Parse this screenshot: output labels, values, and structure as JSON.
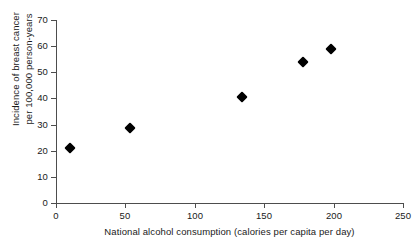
{
  "chart_data": {
    "type": "scatter",
    "title": "",
    "xlabel": "National alcohol consumption (calories per capita per day)",
    "ylabel_lines": [
      "Incidence of breast cancer",
      "per 100,000 person-years"
    ],
    "ylabel": "Incidence of breast cancer per 100,000 person-years",
    "xlim": [
      0,
      250
    ],
    "ylim": [
      0,
      70
    ],
    "xticks": [
      0,
      50,
      100,
      150,
      200,
      250
    ],
    "xtick_labels": [
      "0",
      "50",
      "100",
      "150",
      "200",
      "250"
    ],
    "yticks": [
      0,
      10,
      20,
      30,
      40,
      50,
      60,
      70
    ],
    "ytick_labels": [
      "0",
      "10",
      "20",
      "30",
      "40",
      "50",
      "60",
      "70"
    ],
    "grid": false,
    "legend": false,
    "marker_style": "filled-diamond",
    "marker_color": "#000000",
    "axis_color": "#4d4d4d",
    "series": [
      {
        "name": "Countries",
        "points": [
          {
            "x": 10,
            "y": 21
          },
          {
            "x": 53,
            "y": 28.5
          },
          {
            "x": 134,
            "y": 40.5
          },
          {
            "x": 178,
            "y": 54
          },
          {
            "x": 198,
            "y": 59
          }
        ]
      }
    ]
  }
}
